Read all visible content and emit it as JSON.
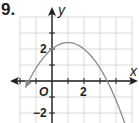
{
  "problem": {
    "number": "9."
  },
  "chart_data": {
    "type": "line",
    "title": "",
    "xlabel": "x",
    "ylabel": "y",
    "origin_label": "O",
    "x_tick_labels": [
      {
        "value": 2,
        "label": "2"
      }
    ],
    "y_tick_labels": [
      {
        "value": 2,
        "label": "2"
      },
      {
        "value": -2,
        "label": "−2"
      }
    ],
    "xlim": [
      -2,
      5
    ],
    "ylim": [
      -2.6,
      4
    ],
    "grid": true,
    "series": [
      {
        "name": "parabola",
        "equation": "y = -0.4(x - 1)^2 + 2.4",
        "vertex": [
          1,
          2.4
        ],
        "y_intercept": 2,
        "roots": [
          -1.45,
          3.45
        ],
        "x": [
          -1.7,
          -1,
          0,
          1,
          2,
          3,
          4,
          4.7
        ],
        "values": [
          -0.52,
          0.8,
          2.0,
          2.4,
          2.0,
          0.8,
          -1.2,
          -3.08
        ],
        "arrows_at_ends": true
      }
    ]
  },
  "colors": {
    "axis": "#231f20",
    "grid": "#d9d9d9",
    "curve": "#8a8a8a"
  }
}
